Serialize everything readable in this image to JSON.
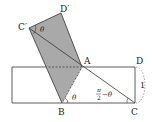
{
  "diagram": {
    "points": {
      "A": {
        "label": "A",
        "x": 82,
        "y": 67
      },
      "B": {
        "label": "B",
        "x": 62,
        "y": 103
      },
      "C": {
        "label": "C",
        "x": 135,
        "y": 103
      },
      "D": {
        "label": "D",
        "x": 135,
        "y": 67
      },
      "C_prime": {
        "label": "C′",
        "x": 29,
        "y": 28
      },
      "D_prime": {
        "label": "D′",
        "x": 61,
        "y": 13
      }
    },
    "rectangle": {
      "x1": 12,
      "y1": 67,
      "x2": 135,
      "y2": 103
    },
    "angles": {
      "at_C_prime": "θ",
      "at_B": "θ",
      "at_C_num": "π",
      "at_C_den": "2",
      "at_C_rest": "−θ"
    },
    "side_label": "1",
    "colors": {
      "shade": "#a8a8a8",
      "line": "#333333"
    }
  }
}
